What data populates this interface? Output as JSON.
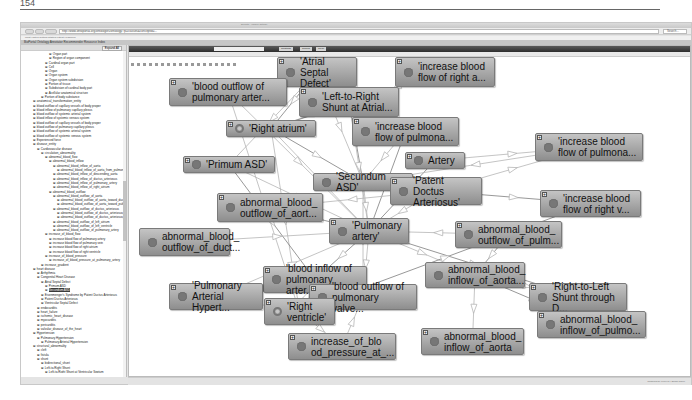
{
  "page": {
    "number": "154"
  },
  "browser": {
    "title": "BioPortal - Visualize Ontology",
    "tab_label": "all_ontology_ontology",
    "url": "http://www.ontoportal.org/ontologies/ontology/?p=classes&conceptid=...",
    "search_placeholder": "Search...",
    "bookmarks": "Most Visited   Getting Started   Latest Headlines",
    "app_header": "BioPortal  Ontology  Annotator  Recommender  Resource Index"
  },
  "left_panel": {
    "button_label": "Expand All",
    "tree": [
      {
        "indent": 7,
        "label": "Organ part"
      },
      {
        "indent": 7,
        "label": "Region of organ component"
      },
      {
        "indent": 6,
        "label": "Cardinal organ part"
      },
      {
        "indent": 6,
        "label": "Cell"
      },
      {
        "indent": 6,
        "label": "Organ"
      },
      {
        "indent": 6,
        "label": "Organ system"
      },
      {
        "indent": 6,
        "label": "Organ system subdivision"
      },
      {
        "indent": 6,
        "label": "Portion of tissue"
      },
      {
        "indent": 6,
        "label": "Subdivision of cardinal body part"
      },
      {
        "indent": 6,
        "label": "Acellular anatomical structure"
      },
      {
        "indent": 5,
        "label": "Portion of body substance"
      },
      {
        "indent": 3,
        "label": "anatomical_transformation_entity"
      },
      {
        "indent": 3,
        "label": "blood outflow of capillary vessels of body proper"
      },
      {
        "indent": 3,
        "label": "blood inflow of pulmonary capillary plexus"
      },
      {
        "indent": 3,
        "label": "blood outflow of systemic arterial system"
      },
      {
        "indent": 3,
        "label": "blood inflow of systemic venous system"
      },
      {
        "indent": 3,
        "label": "blood outflow of capillary vessels of body proper"
      },
      {
        "indent": 3,
        "label": "blood outflow of pulmonary capillary plexus"
      },
      {
        "indent": 3,
        "label": "blood outflow of systemic arterial system"
      },
      {
        "indent": 3,
        "label": "blood outflow of systemic venous system"
      },
      {
        "indent": 3,
        "label": "Experienced force"
      },
      {
        "indent": 3,
        "label": "disease_entity"
      },
      {
        "indent": 4,
        "label": "Cardiovascular disease"
      },
      {
        "indent": 5,
        "label": "circulation_abnormality"
      },
      {
        "indent": 6,
        "label": "abnormal_blood_flow"
      },
      {
        "indent": 7,
        "label": "abnormal_blood_inflow"
      },
      {
        "indent": 8,
        "label": "abnormal_blood_inflow_of_aorta"
      },
      {
        "indent": 9,
        "label": "abnormal_blood_inflow_of_aorta_from_pulmonary_artery"
      },
      {
        "indent": 8,
        "label": "abnormal_blood_inflow_of_descending_aorta"
      },
      {
        "indent": 8,
        "label": "abnormal_blood_inflow_of_ductus_arteriosus"
      },
      {
        "indent": 8,
        "label": "abnormal_blood_inflow_of_pulmonary_artery"
      },
      {
        "indent": 8,
        "label": "abnormal_blood_inflow_of_right_atrium"
      },
      {
        "indent": 7,
        "label": "abnormal_blood_outflow"
      },
      {
        "indent": 8,
        "label": "abnormal_blood_outflow_of_aorta"
      },
      {
        "indent": 9,
        "label": "abnormal_blood_outflow_of_aorta_toward_ductus_arteriosus"
      },
      {
        "indent": 9,
        "label": "abnormal_blood_outflow_of_aorta_toward_pulmonary_artery"
      },
      {
        "indent": 8,
        "label": "abnormal_blood_outflow_of_ductus_arteriosus"
      },
      {
        "indent": 9,
        "label": "abnormal_blood_outflow_of_ductus_arteriosus_toward_aorta"
      },
      {
        "indent": 9,
        "label": "abnormal_blood_outflow_of_ductus_arteriosus_toward_pulmonary_artery"
      },
      {
        "indent": 8,
        "label": "abnormal_blood_outflow_of_left_atrium"
      },
      {
        "indent": 8,
        "label": "abnormal_blood_outflow_of_left_ventricle"
      },
      {
        "indent": 8,
        "label": "abnormal_blood_outflow_of_pulmonary_artery"
      },
      {
        "indent": 6,
        "label": "increase_of_blood_flow"
      },
      {
        "indent": 7,
        "label": "increase blood flow of pulmonary artery"
      },
      {
        "indent": 7,
        "label": "increase blood flow of pulmonary vein"
      },
      {
        "indent": 7,
        "label": "increase blood flow of right atrium"
      },
      {
        "indent": 7,
        "label": "increase blood flow of right ventricle"
      },
      {
        "indent": 6,
        "label": "increase_of_blood_pressure"
      },
      {
        "indent": 7,
        "label": "increase_of_blood_pressure_at_pulmonary_artery"
      },
      {
        "indent": 5,
        "label": "increase_gradient"
      },
      {
        "indent": 3,
        "label": "heart disease"
      },
      {
        "indent": 4,
        "label": "Arrhythmia"
      },
      {
        "indent": 4,
        "label": "Congenital Heart Disease"
      },
      {
        "indent": 5,
        "label": "Atrial Septal Defect"
      },
      {
        "indent": 6,
        "label": "Primum ASD"
      },
      {
        "indent": 6,
        "label": "Secundum ASD",
        "selected": true
      },
      {
        "indent": 5,
        "label": "Eisenmenger's Syndrome by Patent Ductus Arteriosus"
      },
      {
        "indent": 5,
        "label": "Patent Ductus Arteriosus"
      },
      {
        "indent": 5,
        "label": "Ventricular Septal Defect"
      },
      {
        "indent": 4,
        "label": "endocarditis"
      },
      {
        "indent": 4,
        "label": "heart_failure"
      },
      {
        "indent": 4,
        "label": "ischemic_heart_disease"
      },
      {
        "indent": 4,
        "label": "myocarditis"
      },
      {
        "indent": 4,
        "label": "pericarditis"
      },
      {
        "indent": 4,
        "label": "valvular_disease_of_the_heart"
      },
      {
        "indent": 3,
        "label": "Hypertension"
      },
      {
        "indent": 4,
        "label": "Pulmonary Hypertension"
      },
      {
        "indent": 5,
        "label": "Pulmonary Arterial Hypertension"
      },
      {
        "indent": 3,
        "label": "structural_abnormality"
      },
      {
        "indent": 4,
        "label": "cleft"
      },
      {
        "indent": 4,
        "label": "fistula"
      },
      {
        "indent": 4,
        "label": "shunt"
      },
      {
        "indent": 5,
        "label": "bidirectional_shunt"
      },
      {
        "indent": 5,
        "label": "Left-to-Right Shunt"
      },
      {
        "indent": 6,
        "label": "Left-to-Right Shunt at Ventricular Septum"
      },
      {
        "indent": 6,
        "label": "Left-to-Right Shunt at Atrial Septum"
      },
      {
        "indent": 6,
        "label": "Left-to-Right Shunt through Ductus Arteriosus"
      },
      {
        "indent": 5,
        "label": "Right-to-Left Shunt"
      },
      {
        "indent": 6,
        "label": "Right-to-Left Shunt through Ductus Arteriosus"
      }
    ]
  },
  "graph_panel": {
    "search_value": "",
    "tabs": [
      "Contains",
      "Search",
      "Clear"
    ],
    "status_text": "Powered by FlexViz  |  Zoom 100%",
    "colors": {
      "node_top": "#c4c4c4",
      "node_bottom": "#8e8e8e",
      "edge": "#b5b5b5",
      "edge_dark": "#7d7d7d"
    },
    "nodes": [
      {
        "id": "asd",
        "label": "'Atrial Septal\nDefect'",
        "x": 148,
        "y": 0,
        "w": 80,
        "h": 30,
        "plus": true
      },
      {
        "id": "ibf_ra",
        "label": "'increase blood\nflow of right a...",
        "x": 266,
        "y": 0,
        "w": 100,
        "h": 30,
        "plus": true
      },
      {
        "id": "bo_pa",
        "label": "'blood outflow of\npulmonary arter...",
        "x": 40,
        "y": 21,
        "w": 118,
        "h": 28,
        "plus": true
      },
      {
        "id": "ltr",
        "label": "'Left-to-Right\nShunt at Atrial...",
        "x": 170,
        "y": 30,
        "w": 100,
        "h": 30,
        "plus": true
      },
      {
        "id": "ra",
        "label": "'Right atrium'",
        "x": 97,
        "y": 63,
        "w": 90,
        "h": 17,
        "plus": true,
        "hollow": true
      },
      {
        "id": "ibf_pu",
        "label": "'increase blood\nflow of pulmona...",
        "x": 223,
        "y": 60,
        "w": 107,
        "h": 29,
        "plus": true
      },
      {
        "id": "ibf_pu2",
        "label": "'increase blood\nflow of pulmona...",
        "x": 406,
        "y": 76,
        "w": 108,
        "h": 28,
        "plus": true
      },
      {
        "id": "primum",
        "label": "'Primum ASD'",
        "x": 54,
        "y": 99,
        "w": 92,
        "h": 17,
        "plus": true
      },
      {
        "id": "artery",
        "label": "Artery",
        "x": 276,
        "y": 95,
        "w": 60,
        "h": 17,
        "plus": true
      },
      {
        "id": "secundum",
        "label": "'Secundum ASD'",
        "x": 184,
        "y": 116,
        "w": 100,
        "h": 18,
        "plus": false
      },
      {
        "id": "pda",
        "label": "'Patent Doctus\nArteriosus'",
        "x": 261,
        "y": 120,
        "w": 92,
        "h": 28,
        "plus": true
      },
      {
        "id": "ibf_rv",
        "label": "'increase blood\nflow of right v...",
        "x": 411,
        "y": 133,
        "w": 101,
        "h": 27,
        "plus": true
      },
      {
        "id": "abo_aort",
        "label": "abnormal_blood_\noutflow_of_aort...",
        "x": 88,
        "y": 136,
        "w": 106,
        "h": 29,
        "plus": true
      },
      {
        "id": "pa",
        "label": "'Pulmonary\nartery'",
        "x": 200,
        "y": 161,
        "w": 80,
        "h": 26,
        "plus": true
      },
      {
        "id": "abo_pulm",
        "label": "abnormal_blood_\noutflow_of_pulm...",
        "x": 326,
        "y": 164,
        "w": 107,
        "h": 27,
        "plus": true
      },
      {
        "id": "abo_duct",
        "label": "abnormal_blood_\noutflow_of_duct...",
        "x": 10,
        "y": 171,
        "w": 91,
        "h": 28,
        "plus": false
      },
      {
        "id": "bi_pa",
        "label": "'blood inflow of\npulmonary arter...",
        "x": 134,
        "y": 209,
        "w": 104,
        "h": 27,
        "plus": true
      },
      {
        "id": "abi_aorta1",
        "label": "abnormal_blood_\ninflow_of_aorta...",
        "x": 296,
        "y": 205,
        "w": 100,
        "h": 26,
        "plus": false
      },
      {
        "id": "pah",
        "label": "'Pulmonary\nArterial Hypert...",
        "x": 40,
        "y": 226,
        "w": 94,
        "h": 27,
        "plus": true
      },
      {
        "id": "bo_pv",
        "label": "'blood outflow of\npulmonary valve...",
        "x": 180,
        "y": 227,
        "w": 108,
        "h": 26,
        "plus": true
      },
      {
        "id": "rtl",
        "label": "'Right-to-Left\nShunt through D...",
        "x": 400,
        "y": 226,
        "w": 98,
        "h": 28,
        "plus": true
      },
      {
        "id": "rv",
        "label": "'Right\nventricle'",
        "x": 135,
        "y": 241,
        "w": 71,
        "h": 27,
        "plus": true,
        "hollow": true
      },
      {
        "id": "abi_pulmo",
        "label": "abnormal_blood_\ninflow_of_pulmo...",
        "x": 408,
        "y": 254,
        "w": 109,
        "h": 27,
        "plus": true
      },
      {
        "id": "inc_bp",
        "label": "increase_of_blo\nod_pressure_at_...",
        "x": 159,
        "y": 276,
        "w": 108,
        "h": 27,
        "plus": true
      },
      {
        "id": "abi_aorta2",
        "label": "abnormal_blood_\ninflow_of_aorta",
        "x": 292,
        "y": 271,
        "w": 103,
        "h": 27,
        "plus": true
      }
    ]
  }
}
